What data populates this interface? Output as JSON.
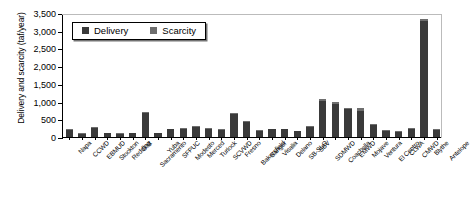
{
  "chart_data": {
    "type": "bar",
    "title": "",
    "xlabel": "",
    "ylabel": "Delivery and scarcity (taf/year)",
    "ylim": [
      0,
      3500
    ],
    "yticks": [
      "0",
      "500",
      "1,000",
      "1,500",
      "2,000",
      "2,500",
      "3,000",
      "3,500"
    ],
    "ytick_values": [
      0,
      500,
      1000,
      1500,
      2000,
      2500,
      3000,
      3500
    ],
    "grid": false,
    "stacked": true,
    "legend_position": "top-left",
    "legend": [
      "Delivery",
      "Scarcity"
    ],
    "categories": [
      "Napa",
      "CCWD",
      "EBMUD",
      "Stockton",
      "Redding",
      "Galt",
      "Sacramento",
      "Yuba",
      "SFPUC",
      "Modesto",
      "Merced",
      "Turlock",
      "SCVWD",
      "Fresno",
      "Bakersfield",
      "Sanger",
      "Visalia",
      "Delano",
      "SB-SLO",
      "SBV",
      "SDMWD",
      "Coachella",
      "EMWD",
      "Mojave",
      "Ventura",
      "El Centro",
      "CLWA",
      "CMWD",
      "Blythe",
      "Antelope"
    ],
    "series": [
      {
        "name": "Delivery",
        "color": "#3a3a3a",
        "values": [
          190,
          95,
          260,
          100,
          95,
          100,
          680,
          100,
          215,
          230,
          275,
          225,
          195,
          660,
          420,
          175,
          215,
          215,
          160,
          280,
          1020,
          930,
          790,
          730,
          330,
          175,
          150,
          230,
          3280,
          210
        ]
      },
      {
        "name": "Scarcity",
        "color": "#6e6e6e",
        "values": [
          25,
          10,
          25,
          10,
          8,
          10,
          20,
          10,
          20,
          25,
          25,
          20,
          18,
          25,
          30,
          15,
          18,
          18,
          14,
          25,
          55,
          45,
          40,
          95,
          30,
          15,
          12,
          20,
          60,
          18
        ]
      }
    ]
  }
}
